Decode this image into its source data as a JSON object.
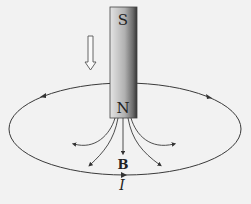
{
  "diagram": {
    "magnet": {
      "top_label": "S",
      "bottom_label": "N",
      "x": 110,
      "y": 7,
      "width": 27,
      "height": 111,
      "gradient": [
        "#e6e6e6",
        "#b4b4b4",
        "#3c3c3c"
      ]
    },
    "motion_arrow": {
      "direction": "down",
      "label": ""
    },
    "loop": {
      "cx": 125,
      "cy": 129,
      "rx": 116,
      "ry": 46,
      "direction": "counterclockwise-from-above"
    },
    "field_label": "B",
    "current_label": "I",
    "colors": {
      "line": "#3a3a3a",
      "background": "#f2f2f2"
    }
  }
}
